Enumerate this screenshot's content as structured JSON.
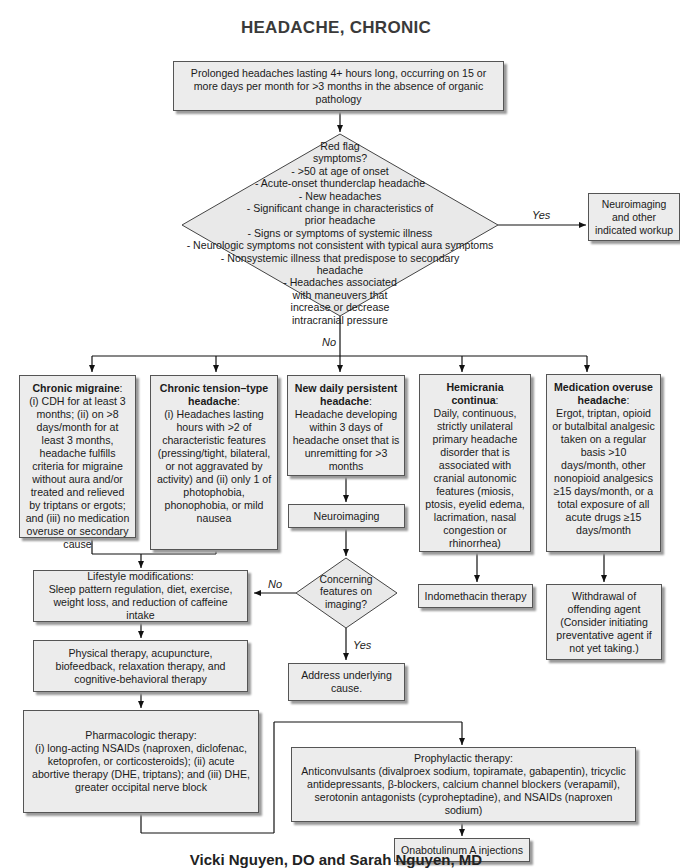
{
  "title": "HEADACHE, CHRONIC",
  "start": {
    "text": "Prolonged headaches lasting 4+ hours long, occurring on 15 or more days per month for >3 months in the absence of organic pathology"
  },
  "red_flag": {
    "question": "Red flag symptoms?",
    "items": [
      "- >50 at age of onset",
      "- Acute-onset thunderclap headache",
      "- New headaches",
      "- Significant change in characteristics of prior headache",
      "- Signs or symptoms of systemic illness",
      "- Neurologic symptoms not consistent with typical aura symptoms",
      "- Nonsystemic illness that predispose to secondary headache",
      "- Headaches associated with maneuvers that increase or decrease intracranial pressure"
    ],
    "yes_label": "Yes",
    "no_label": "No"
  },
  "neuroimaging_workup": "Neuroimaging and other indicated workup",
  "types": [
    {
      "name": "Chronic migraine",
      "desc": "(i) CDH for at least 3 months; (ii) on >8 days/month for at least 3 months, headache fulfills criteria for migraine without aura and/or treated and relieved by triptans or ergots; and (iii) no medication overuse or secondary cause"
    },
    {
      "name": "Chronic tension–type headache",
      "desc": "(i) Headaches lasting hours with >2 of characteristic features (pressing/tight, bilateral, or not aggravated by activity) and (ii) only 1 of photophobia, phonophobia, or mild nausea"
    },
    {
      "name": "New daily persistent headache",
      "desc": "Headache developing within 3 days of headache onset that is unremitting for >3 months"
    },
    {
      "name": "Hemicrania continua",
      "desc": "Daily, continuous, strictly unilateral primary headache disorder that is associated with cranial autonomic features (miosis, ptosis, eyelid edema, lacrimation, nasal congestion or rhinorrhea)"
    },
    {
      "name": "Medication overuse headache",
      "desc": "Ergot, triptan, opioid or butalbital analgesic taken on a regular basis >10 days/month, other nonopioid analgesics ≥15 days/month, or a total exposure of all acute drugs ≥15 days/month"
    }
  ],
  "neuroimaging": "Neuroimaging",
  "concerning": {
    "question": "Concerning features on imaging?",
    "yes_label": "Yes",
    "no_label": "No"
  },
  "address_cause": "Address underlying cause.",
  "indomethacin": "Indomethacin therapy",
  "withdrawal": "Withdrawal of offending agent (Consider initiating preventative agent if not yet taking.)",
  "lifestyle": {
    "heading": "Lifestyle modifications:",
    "text": "Sleep pattern regulation, diet, exercise, weight loss, and reduction of caffeine intake"
  },
  "physical": "Physical therapy, acupuncture, biofeedback, relaxation therapy, and cognitive-behavioral therapy",
  "pharmacologic": {
    "heading": "Pharmacologic therapy:",
    "text": "(i) long-acting NSAIDs (naproxen, diclofenac, ketoprofen, or corticosteroids); (ii) acute abortive therapy (DHE, triptans); and (iii) DHE, greater occipital nerve block"
  },
  "prophylactic": {
    "heading": "Prophylactic therapy:",
    "text": "Anticonvulsants (divalproex sodium, topiramate, gabapentin), tricyclic antidepressants, β-blockers, calcium channel blockers (verapamil), serotonin antagonists (cyproheptadine), and NSAIDs (naproxen sodium)"
  },
  "onabotulinum": "Onabotulinum A injections",
  "credit": "Vicki Nguyen, DO and Sarah Nguyen, MD"
}
